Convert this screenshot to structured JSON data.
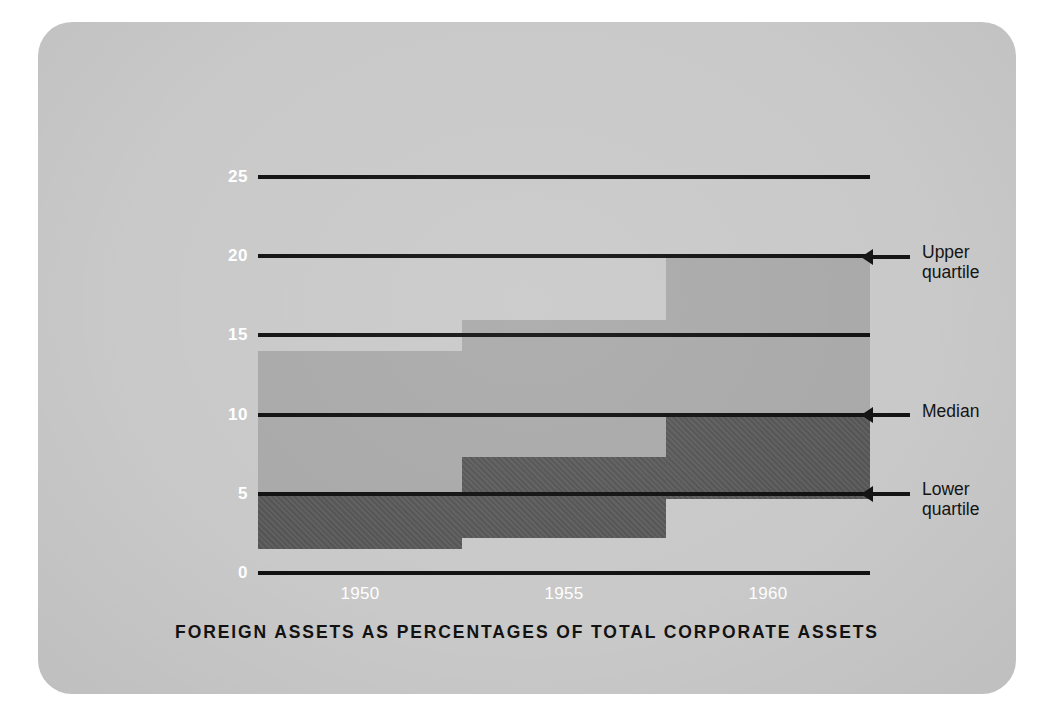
{
  "caption": "FOREIGN ASSETS AS PERCENTAGES OF TOTAL CORPORATE ASSETS",
  "axis": {
    "ylabel": "Percentage of  total assets",
    "yticks": [
      "25",
      "20",
      "15",
      "10",
      "5",
      "0"
    ],
    "xticks": [
      "1950",
      "1955",
      "1960"
    ]
  },
  "annotations": {
    "upper": "Upper\nquartile",
    "median": "Median",
    "lower": "Lower\nquartile"
  },
  "colors": {
    "card": "#c9c9c9",
    "interquartile_band": "#a9a9a9",
    "lower_band": "#585858",
    "gridline": "#111111",
    "tick_text": "#ffffff",
    "annotation_text": "#141414"
  },
  "chart_data": {
    "type": "bar",
    "title": "FOREIGN ASSETS AS PERCENTAGES OF TOTAL CORPORATE ASSETS",
    "subtitle": "",
    "xlabel": "",
    "ylabel": "Percentage of total assets",
    "ylim": [
      0,
      25
    ],
    "yticks": [
      0,
      5,
      10,
      15,
      20,
      25
    ],
    "xticks": [
      1950,
      1955,
      1960
    ],
    "xlim": [
      1947.5,
      1962.5
    ],
    "grid": "horizontal",
    "legend": "none",
    "note": "Step chart of the quartile distribution of foreign assets as a percentage of total corporate assets; three step periods. Dark band spans lower quartile to median, medium band spans median to upper quartile.",
    "categories": [
      "1947.5-1952.5",
      "1952.5-1957.5",
      "1957.5-1962.5"
    ],
    "series": [
      {
        "name": "Lower quartile",
        "values": [
          1.5,
          2.2,
          4.7
        ]
      },
      {
        "name": "Median",
        "values": [
          5.0,
          7.3,
          10.0
        ]
      },
      {
        "name": "Upper quartile",
        "values": [
          14.0,
          16.0,
          20.0
        ]
      }
    ],
    "steps": [
      {
        "x_start": 1947.5,
        "x_end": 1952.5,
        "lower_quartile": 1.5,
        "median": 5.0,
        "upper_quartile": 14.0
      },
      {
        "x_start": 1952.5,
        "x_end": 1957.5,
        "lower_quartile": 2.2,
        "median": 7.3,
        "upper_quartile": 16.0
      },
      {
        "x_start": 1957.5,
        "x_end": 1962.5,
        "lower_quartile": 4.7,
        "median": 10.0,
        "upper_quartile": 20.0
      }
    ]
  }
}
